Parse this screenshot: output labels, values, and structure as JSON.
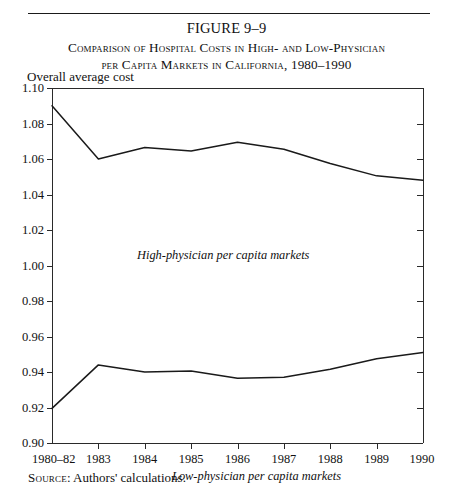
{
  "figure": {
    "number": "FIGURE 9–9",
    "title_line1": "Comparison of Hospital Costs in High- and Low-Physician",
    "title_line2": "per Capita Markets in California, 1980–1990",
    "source_prefix": "Source",
    "source_text": ": Authors' calculations."
  },
  "chart_data": {
    "type": "line",
    "title": "Comparison of Hospital Costs in High- and Low-Physician per Capita Markets in California, 1980–1990",
    "xlabel": "",
    "ylabel": "Overall average cost",
    "categories": [
      "1980–82",
      "1983",
      "1984",
      "1985",
      "1986",
      "1987",
      "1988",
      "1989",
      "1990"
    ],
    "ylim": [
      0.9,
      1.1
    ],
    "yticks": [
      "0.90",
      "0.92",
      "0.94",
      "0.96",
      "0.98",
      "1.00",
      "1.02",
      "1.04",
      "1.06",
      "1.08",
      "1.10"
    ],
    "ytick_values": [
      0.9,
      0.92,
      0.94,
      0.96,
      0.98,
      1.0,
      1.02,
      1.04,
      1.06,
      1.08,
      1.1
    ],
    "grid": false,
    "legend_position": "inline-annotation",
    "series": [
      {
        "name": "High-physician per capita markets",
        "values": [
          1.09,
          1.06,
          1.0665,
          1.0645,
          1.0695,
          1.0655,
          1.0575,
          1.0505,
          1.048
        ]
      },
      {
        "name": "Low-physician per capita markets",
        "values": [
          0.9195,
          0.944,
          0.94,
          0.9405,
          0.9365,
          0.937,
          0.9415,
          0.9475,
          0.951
        ]
      }
    ],
    "annotations": [
      "High-physician per capita markets",
      "Low-physician per capita markets"
    ]
  }
}
